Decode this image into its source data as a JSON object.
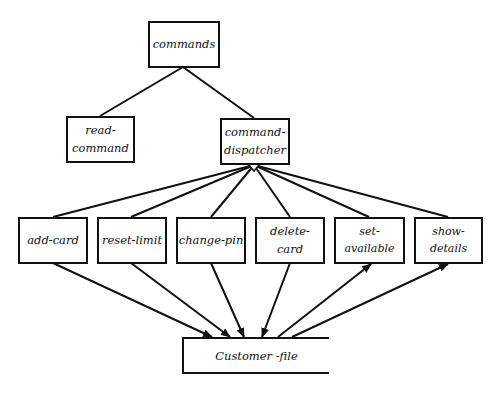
{
  "diagram": {
    "type": "structure-chart",
    "root": {
      "label": "commands"
    },
    "level1": [
      {
        "label": "read-\ncommand",
        "line1": "read-",
        "line2": "command"
      },
      {
        "label": "command-\ndispatcher",
        "line1": "command-",
        "line2": "dispatcher"
      }
    ],
    "level2": [
      {
        "label": "add-card",
        "data_flow": "to-file"
      },
      {
        "label": "reset-limit",
        "data_flow": "to-file"
      },
      {
        "label": "change-pin",
        "data_flow": "to-file"
      },
      {
        "label": "delete-card",
        "data_flow": "to-file"
      },
      {
        "label": "set-available",
        "data_flow": "from-file"
      },
      {
        "label": "show-details",
        "data_flow": "from-file"
      }
    ],
    "data_store": {
      "label": "Customer -file"
    },
    "dispatcher_symbol": "diamond-selection"
  }
}
